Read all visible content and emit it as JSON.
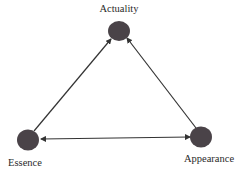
{
  "diagram": {
    "type": "triangle-network",
    "nodes": [
      {
        "id": "actuality",
        "label": "Actuality",
        "x": 119,
        "y": 31
      },
      {
        "id": "essence",
        "label": "Essence",
        "x": 28,
        "y": 140
      },
      {
        "id": "appearance",
        "label": "Appearance",
        "x": 201,
        "y": 137
      }
    ],
    "edges": [
      {
        "from": "essence",
        "to": "actuality",
        "arrow": "to"
      },
      {
        "from": "appearance",
        "to": "actuality",
        "arrow": "to"
      },
      {
        "from": "essence",
        "to": "appearance",
        "arrow": "both"
      }
    ],
    "colors": {
      "node": "#4a4348",
      "edge": "#333333",
      "text": "#2a2a2a"
    }
  }
}
